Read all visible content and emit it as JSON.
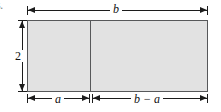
{
  "figure": {
    "number": "5.",
    "type": "geometry-diagram"
  },
  "colors": {
    "rect_fill": "#e2e2e2",
    "rect_stroke": "#57585a",
    "dimension_line": "#1c1c1c",
    "background": "#ffffff",
    "figure_number": "#8a8a8a"
  },
  "shape": {
    "name": "rectangle",
    "divider_name": "vertical-divider"
  },
  "dimensions": {
    "top": {
      "label": "b",
      "name": "width-total",
      "orientation": "horizontal",
      "position": "top"
    },
    "left": {
      "label": "2",
      "name": "height",
      "orientation": "vertical",
      "position": "left"
    },
    "bottom_left": {
      "label": "a",
      "name": "width-left-segment",
      "orientation": "horizontal",
      "position": "bottom"
    },
    "bottom_right": {
      "label": "b − a",
      "name": "width-right-segment",
      "orientation": "horizontal",
      "position": "bottom"
    }
  }
}
